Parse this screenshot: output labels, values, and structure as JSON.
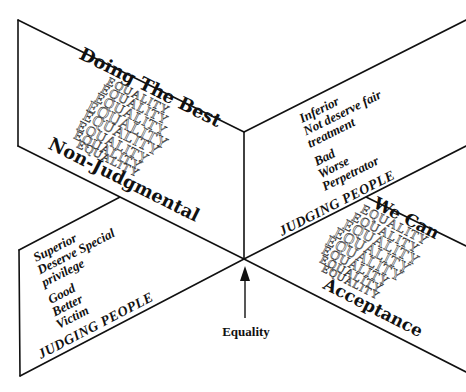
{
  "diagram": {
    "top_left_panel": {
      "title": "Doing The Best",
      "subtitle": "Non-Judgmental",
      "pattern_word": "EQUALITY",
      "pattern_rows": [
        "EQUALITY",
        "EQUALITY",
        "EQUALITY",
        "EQUALITY",
        "EQUALITY",
        "EQUALITY",
        "EQUALITY",
        "EQUALITY"
      ]
    },
    "top_right_panel": {
      "lines": [
        "Inferior",
        "Not deserve fair",
        "treatment",
        "Bad",
        "Worse",
        "Perpetrator"
      ],
      "footer": "JUDGING PEOPLE"
    },
    "bottom_left_panel": {
      "lines": [
        "Superior",
        "Deserve Special",
        "privilege",
        "Good",
        "Better",
        "Victim"
      ],
      "footer": "JUDGING PEOPLE"
    },
    "bottom_right_panel": {
      "title": "We Can",
      "subtitle": "Acceptance",
      "pattern_word": "EQUALITY",
      "pattern_rows": [
        "EQUALITY",
        "EQUALITY",
        "EQUALITY",
        "EQUALITY",
        "EQUALITY",
        "EQUALITY",
        "EQUALITY",
        "EQUALITY"
      ]
    },
    "center_label": "Equality",
    "colors": {
      "line": "#111111",
      "background": "#ffffff"
    }
  }
}
